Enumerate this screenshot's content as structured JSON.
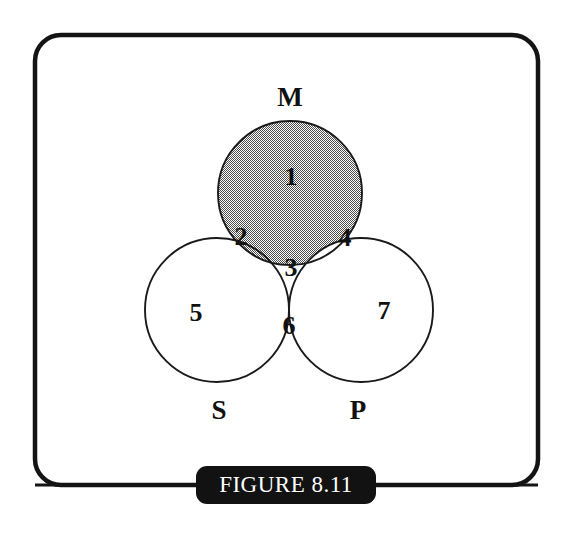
{
  "figure": {
    "caption": "FIGURE 8.11",
    "frame": {
      "border_color": "#141414",
      "background_color": "#ffffff",
      "border_width_px": 4,
      "corner_radius_px": 26
    },
    "caption_plate": {
      "background_color": "#121212",
      "text_color": "#ffffff"
    }
  },
  "diagram": {
    "type": "venn-3-set",
    "shading_color": "#9a9a9a",
    "outline_color": "#1a1a1a",
    "fill_color": "#ffffff",
    "sets": [
      {
        "id": "M",
        "label": "M",
        "label_x": 290,
        "label_y": 97,
        "cx": 290,
        "cy": 193,
        "r": 72
      },
      {
        "id": "S",
        "label": "S",
        "label_x": 219,
        "label_y": 410,
        "cx": 217,
        "cy": 310,
        "r": 72
      },
      {
        "id": "P",
        "label": "P",
        "label_x": 358,
        "label_y": 410,
        "cx": 361,
        "cy": 310,
        "r": 72
      }
    ],
    "regions": [
      {
        "number": "1",
        "members": "M only",
        "shaded": true,
        "x": 291,
        "y": 177
      },
      {
        "number": "2",
        "members": "M and S",
        "shaded": true,
        "x": 241,
        "y": 237
      },
      {
        "number": "3",
        "members": "M, S and P",
        "shaded": false,
        "x": 291,
        "y": 268
      },
      {
        "number": "4",
        "members": "M and P",
        "shaded": false,
        "x": 345,
        "y": 238
      },
      {
        "number": "5",
        "members": "S only",
        "shaded": false,
        "x": 196,
        "y": 313
      },
      {
        "number": "6",
        "members": "S and P",
        "shaded": false,
        "x": 289,
        "y": 326
      },
      {
        "number": "7",
        "members": "P only",
        "shaded": false,
        "x": 384,
        "y": 311
      }
    ]
  }
}
